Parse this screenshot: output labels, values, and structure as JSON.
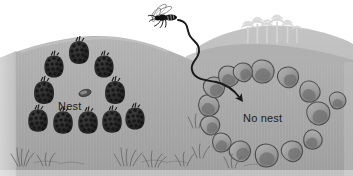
{
  "figure": {
    "sky_color": "#ffffff",
    "ground_color": "#a9a9a9",
    "ground_far_color": "#bcbcbc",
    "ground_light_color": "#c6c6c6",
    "soil_edge_color": "#cfcfcf",
    "stone_color": "#9a9a9a",
    "stone_shadow_color": "#6f6f6f",
    "stone_outline_color": "#4a4a4a",
    "cone_color": "#2a2a2a",
    "path_color": "#181818",
    "tree_color": "#d8d8d8",
    "grass_color": "#6d6d6d",
    "text_color": "#1c1c1c"
  },
  "labels": {
    "nest": "Nest",
    "no_nest": "No nest"
  },
  "elements": {
    "insect": "wasp-icon",
    "flight_path": "flight-path-arrow",
    "nest_marker": "nest-entrance-oval",
    "left_landmarks": "pine-cone-ring",
    "right_landmarks": "stone-ring",
    "background_trees": "distant-tree-line",
    "foreground_grass": "grass-tufts"
  },
  "counts": {
    "pine_cones": 10,
    "stones": 15,
    "trees": 6
  },
  "cones": [
    {
      "x": 79,
      "y": 52,
      "s": 1.0
    },
    {
      "x": 54,
      "y": 66,
      "s": 0.96
    },
    {
      "x": 104,
      "y": 66,
      "s": 0.96
    },
    {
      "x": 44,
      "y": 92,
      "s": 1.0
    },
    {
      "x": 115,
      "y": 92,
      "s": 1.0
    },
    {
      "x": 38,
      "y": 120,
      "s": 0.98
    },
    {
      "x": 63,
      "y": 122,
      "s": 0.98
    },
    {
      "x": 88,
      "y": 122,
      "s": 0.98
    },
    {
      "x": 112,
      "y": 121,
      "s": 0.98
    },
    {
      "x": 135,
      "y": 118,
      "s": 0.96
    }
  ],
  "stones": [
    {
      "x": 262,
      "y": 72,
      "r": 12,
      "a": 12
    },
    {
      "x": 288,
      "y": 78,
      "r": 11,
      "a": -18
    },
    {
      "x": 309,
      "y": 92,
      "r": 11,
      "a": 26
    },
    {
      "x": 318,
      "y": 114,
      "r": 12,
      "a": -8
    },
    {
      "x": 312,
      "y": 140,
      "r": 10,
      "a": 34
    },
    {
      "x": 292,
      "y": 152,
      "r": 11,
      "a": -25
    },
    {
      "x": 266,
      "y": 156,
      "r": 12,
      "a": 10
    },
    {
      "x": 240,
      "y": 152,
      "r": 11,
      "a": -30
    },
    {
      "x": 221,
      "y": 143,
      "r": 10,
      "a": 18
    },
    {
      "x": 210,
      "y": 126,
      "r": 10,
      "a": -14
    },
    {
      "x": 208,
      "y": 106,
      "r": 11,
      "a": 22
    },
    {
      "x": 214,
      "y": 88,
      "r": 11,
      "a": -20
    },
    {
      "x": 228,
      "y": 77,
      "r": 11,
      "a": 16
    },
    {
      "x": 243,
      "y": 73,
      "r": 10,
      "a": -28
    },
    {
      "x": 337,
      "y": 101,
      "r": 9,
      "a": 8
    }
  ]
}
